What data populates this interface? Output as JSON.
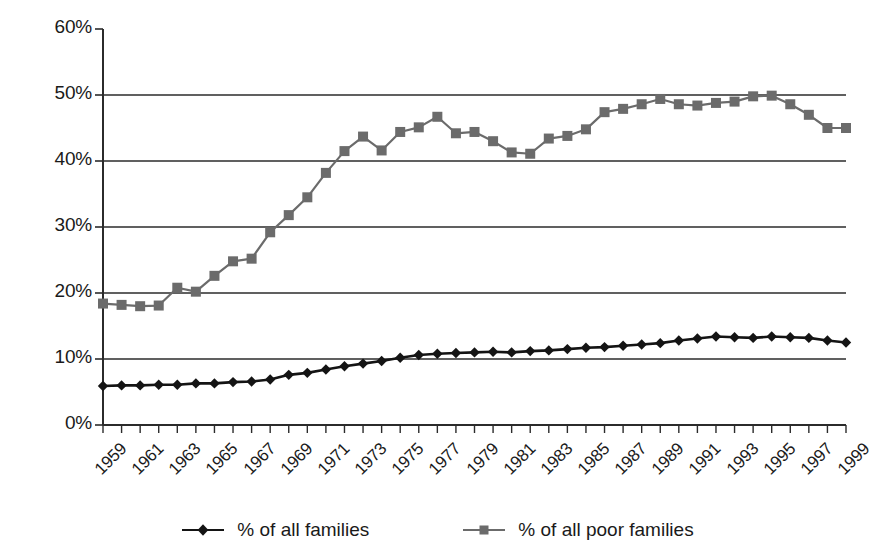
{
  "chart_data": {
    "type": "line",
    "title": "",
    "subtitle": "",
    "xlabel": "",
    "ylabel": "",
    "xlim": [
      1959,
      1999
    ],
    "ylim": [
      0,
      60
    ],
    "ytick_step": 10,
    "ytick_labels": [
      "0%",
      "10%",
      "20%",
      "30%",
      "40%",
      "50%",
      "60%"
    ],
    "ytick_values": [
      0,
      10,
      20,
      30,
      40,
      50,
      60
    ],
    "grid": "horizontal",
    "legend_position": "bottom",
    "x": [
      1959,
      1960,
      1961,
      1962,
      1963,
      1964,
      1965,
      1966,
      1967,
      1968,
      1969,
      1970,
      1971,
      1972,
      1973,
      1974,
      1975,
      1976,
      1977,
      1978,
      1979,
      1980,
      1981,
      1982,
      1983,
      1984,
      1985,
      1986,
      1987,
      1988,
      1989,
      1990,
      1991,
      1992,
      1993,
      1994,
      1995,
      1996,
      1997,
      1998,
      1999
    ],
    "xtick_labels": [
      "1959",
      "1961",
      "1963",
      "1965",
      "1967",
      "1969",
      "1971",
      "1973",
      "1975",
      "1977",
      "1979",
      "1981",
      "1983",
      "1985",
      "1987",
      "1989",
      "1991",
      "1993",
      "1995",
      "1997",
      "1999"
    ],
    "series": [
      {
        "name": "% of all families",
        "color": "#141414",
        "marker": "diamond",
        "values": [
          5.9,
          6.0,
          6.0,
          6.1,
          6.1,
          6.3,
          6.3,
          6.5,
          6.6,
          6.9,
          7.6,
          7.9,
          8.4,
          8.9,
          9.3,
          9.7,
          10.2,
          10.6,
          10.8,
          10.9,
          11.0,
          11.1,
          11.0,
          11.2,
          11.3,
          11.5,
          11.7,
          11.8,
          12.0,
          12.2,
          12.4,
          12.8,
          13.1,
          13.4,
          13.3,
          13.2,
          13.4,
          13.3,
          13.2,
          12.8,
          12.5
        ]
      },
      {
        "name": "% of all poor families",
        "color": "#6b6b6b",
        "marker": "square",
        "values": [
          18.4,
          18.2,
          18.0,
          18.1,
          20.8,
          20.2,
          22.6,
          24.8,
          25.2,
          29.2,
          31.8,
          34.5,
          38.2,
          41.5,
          43.7,
          41.6,
          44.4,
          45.1,
          46.7,
          44.2,
          44.4,
          43.0,
          41.3,
          41.1,
          43.4,
          43.8,
          44.8,
          47.4,
          47.9,
          48.6,
          49.4,
          48.6,
          48.4,
          48.8,
          49.0,
          49.8,
          49.9,
          48.6,
          47.0,
          45.0,
          45.0
        ]
      }
    ]
  },
  "legend": {
    "items": [
      {
        "label": "% of all families",
        "marker": "diamond",
        "color": "#141414"
      },
      {
        "label": "% of all poor families",
        "marker": "square",
        "color": "#6b6b6b"
      }
    ]
  }
}
